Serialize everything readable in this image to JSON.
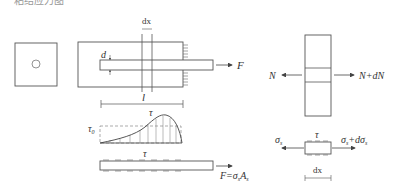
{
  "caption_partial": "粘结应力图",
  "labels": {
    "dx_top": "dx",
    "d": "d",
    "F": "F",
    "l": "l",
    "tau": "τ",
    "tau0": "τ",
    "tau0_sub": "0",
    "tau_bar": "τ",
    "F_eq": "F=σ",
    "F_eq_sub1": "s",
    "F_eq_A": "A",
    "F_eq_sub2": "s",
    "N_left": "N",
    "N_right": "N+dN",
    "sigma_left": "σ",
    "sigma_left_sub": "s",
    "sigma_right": "σ",
    "sigma_right_sub": "s",
    "sigma_right_plus": "+dσ",
    "sigma_right_sub2": "s",
    "tau_elem": "τ",
    "dx_bottom": "dx"
  },
  "colors": {
    "line": "#555555",
    "dash": "#888888"
  }
}
